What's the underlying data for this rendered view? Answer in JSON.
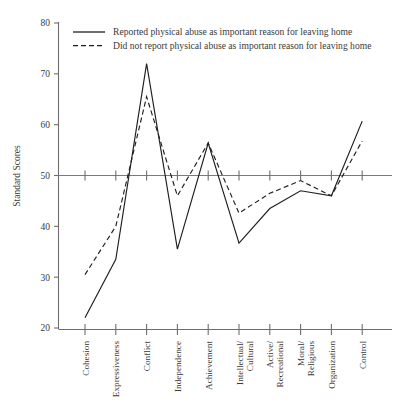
{
  "chart_data": {
    "type": "line",
    "title": "",
    "subtitle": "",
    "xlabel": "",
    "ylabel": "Standard Scores",
    "ylim": [
      20,
      80
    ],
    "yticks": [
      20,
      30,
      40,
      50,
      60,
      70,
      80
    ],
    "ytick_labels": [
      "20",
      "30",
      "40",
      "50",
      "60",
      "70",
      "80"
    ],
    "grid": false,
    "reference_line": 50,
    "legend_position": "top-left",
    "categories": [
      "Cohesion",
      "Expressiveness",
      "Conflict",
      "Independence",
      "Achievement",
      "Intellectual/\nCultural",
      "Active/\nRecreational",
      "Moral/\nReligious",
      "Organization",
      "Control"
    ],
    "category_labels": [
      [
        "Cohesion"
      ],
      [
        "Expressiveness"
      ],
      [
        "Conflict"
      ],
      [
        "Independence"
      ],
      [
        "Achievement"
      ],
      [
        "Intellectual/",
        "Cultural"
      ],
      [
        "Active/",
        "Recreational"
      ],
      [
        "Moral/",
        "Religious"
      ],
      [
        "Organization"
      ],
      [
        "Control"
      ]
    ],
    "series": [
      {
        "name": "Reported physical abuse as important reason for leaving home",
        "style": "solid",
        "color": "#1f1f1f",
        "values": [
          22.0,
          33.5,
          72.0,
          35.5,
          56.4,
          36.7,
          43.5,
          47.0,
          46.0,
          60.7
        ]
      },
      {
        "name": "Did not report physical abuse as important reason for leaving home",
        "style": "dashed",
        "color": "#1f1f1f",
        "values": [
          30.5,
          40.0,
          65.5,
          46.0,
          56.4,
          42.6,
          46.5,
          49.0,
          46.0,
          56.8
        ]
      }
    ]
  },
  "legend": {
    "items": [
      {
        "label": "Reported physical abuse as important reason for leaving home",
        "style": "solid"
      },
      {
        "label": "Did not report physical abuse as important reason for leaving home",
        "style": "dashed"
      }
    ]
  },
  "axes": {
    "y_axis_title": "Standard Scores"
  }
}
